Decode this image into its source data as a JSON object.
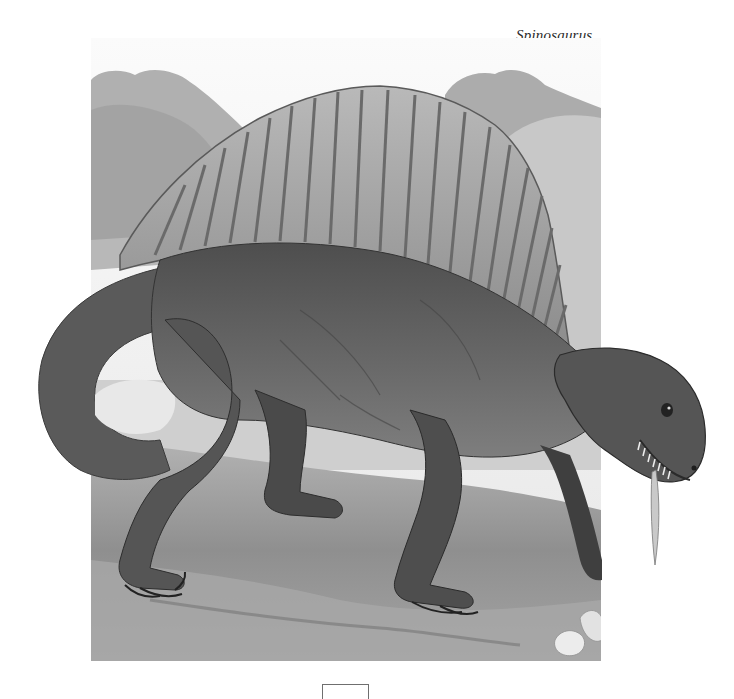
{
  "page": {
    "caption": "Spinosaurus",
    "page_number": ""
  },
  "illustration": {
    "subject": "Spinosaurus",
    "description": "Grayscale painting of a Spinosaurus with a tall ribbed dorsal sail, walking on all fours across a rocky plain, with trees and hills in the background",
    "style": "monochrome painting",
    "colors": {
      "background": "#ffffff",
      "sky": "#efefef",
      "trees": "#a9a9a9",
      "hills": "#c4c4c4",
      "sail": "#a2a2a2",
      "sail_ribs": "#6e6e6e",
      "body": "#5e5e5e",
      "body_dark": "#3f3f3f",
      "belly": "#8a8a8a",
      "ground": "#9c9c9c",
      "ground_dark": "#6c6c6c",
      "rocks": "#e6e6e6"
    }
  }
}
